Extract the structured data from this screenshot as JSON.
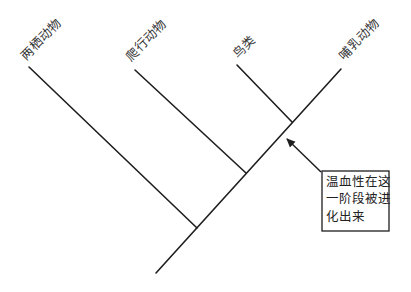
{
  "diagram": {
    "type": "cladogram",
    "taxa": [
      {
        "label": "两栖动物"
      },
      {
        "label": "爬行动物"
      },
      {
        "label": "鸟类"
      },
      {
        "label": "哺乳动物"
      }
    ],
    "annotation": {
      "lines": [
        "温血性在这",
        "一阶段被进",
        "化出来"
      ],
      "points_to": "鸟类与哺乳动物的共同祖先节点"
    },
    "colors": {
      "line": "#1e1e1e",
      "text": "#333333",
      "background": "#ffffff"
    }
  }
}
